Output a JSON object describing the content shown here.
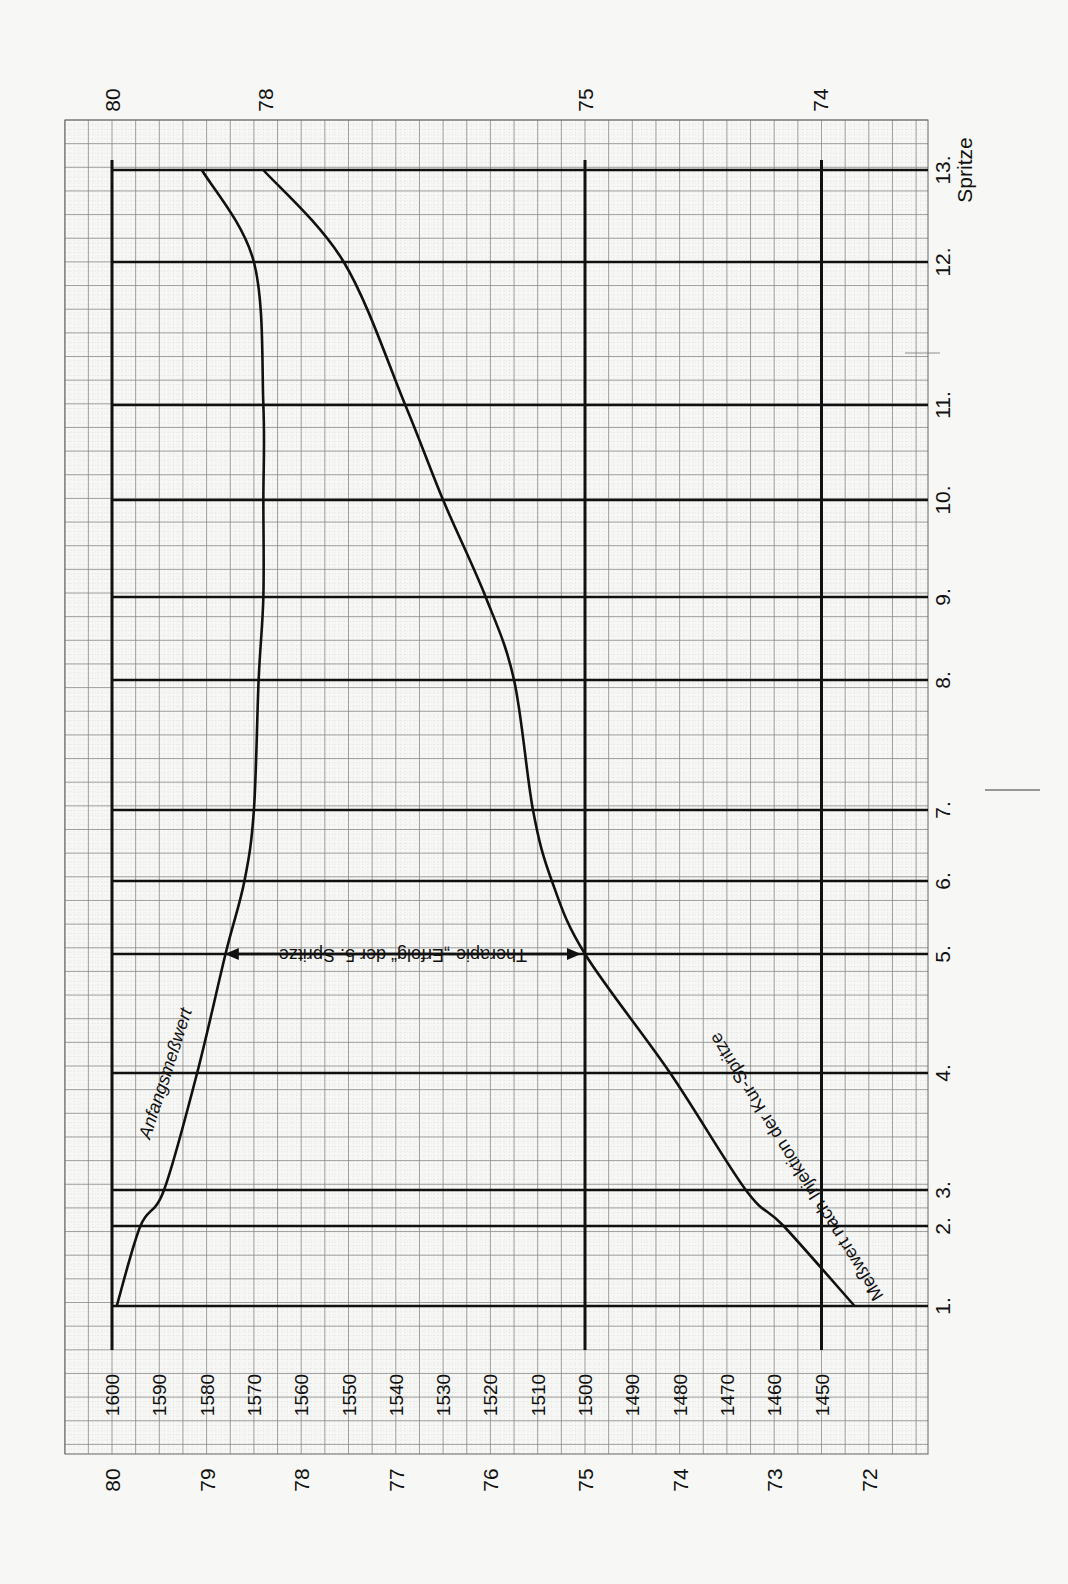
{
  "chart_data": {
    "type": "line",
    "orientation": "rotated-90 (value axis horizontal, injection axis vertical, increasing upward)",
    "title": "",
    "xlabel": "Spritze",
    "ylabel": "",
    "injection_axis": {
      "ticks": [
        "1.",
        "2.",
        "3.",
        "4.",
        "5.",
        "6.",
        "7.",
        "8.",
        "9.",
        "10.",
        "11.",
        "12.",
        "13."
      ],
      "label": "Spritze",
      "positions_px": [
        1306,
        1226,
        1190,
        1073,
        954,
        881,
        810,
        680,
        597,
        500,
        405,
        262,
        170
      ]
    },
    "value_axis_primary": {
      "ticks": [
        "1600",
        "1590",
        "1580",
        "1570",
        "1560",
        "1550",
        "1540",
        "1530",
        "1520",
        "1510",
        "1500",
        "1490",
        "1480",
        "1470",
        "1460",
        "1450"
      ],
      "range": [
        1600,
        1440
      ],
      "major_lines": [
        1600,
        1500,
        1450
      ]
    },
    "value_axis_bottom": {
      "ticks": [
        "80",
        "79",
        "78",
        "77",
        "76",
        "75",
        "74",
        "73",
        "72"
      ]
    },
    "value_axis_top": {
      "ticks": [
        "80",
        "78",
        "75",
        "74"
      ]
    },
    "series": [
      {
        "name": "Anfangsmeßwert",
        "x": [
          1,
          2,
          3,
          4,
          5,
          6,
          7,
          8,
          9,
          10,
          11,
          12,
          13
        ],
        "values": [
          1599,
          1594,
          1589,
          1582,
          1576,
          1572,
          1570,
          1569,
          1568,
          1568,
          1568,
          1570,
          1581
        ]
      },
      {
        "name": "Meßwert nach Injektion der Kur-Spritze",
        "x": [
          1,
          2,
          3,
          4,
          5,
          6,
          7,
          8,
          9,
          10,
          11,
          12,
          13
        ],
        "values": [
          1443,
          1458,
          1466,
          1482,
          1500,
          1507,
          1511,
          1515,
          1521,
          1530,
          1538,
          1551,
          1568
        ]
      }
    ],
    "annotations": [
      {
        "text": "Anfangsmeßwert",
        "type": "series-label"
      },
      {
        "text": "Meßwert nach Injektion der Kur-Spritze",
        "type": "series-label"
      },
      {
        "text": "Therapie-„Erfolg“ der 5. Spritze",
        "type": "double-arrow",
        "at_injection": 5,
        "from": 1577,
        "to": 1500
      }
    ],
    "grid": true,
    "legend": "none (inline labels)"
  },
  "labels": {
    "series1": "Anfangsmeßwert",
    "series2": "Meßwert nach Injektion der Kur-Spritze",
    "arrow": "Therapie-„Erfolg“ der 5. Spritze",
    "spritze": "Spritze"
  },
  "colors": {
    "paper": "#f7f7f5",
    "ink": "#111111",
    "grid_minor": "#c8c8c8",
    "grid_mid": "#8a8a8a"
  }
}
